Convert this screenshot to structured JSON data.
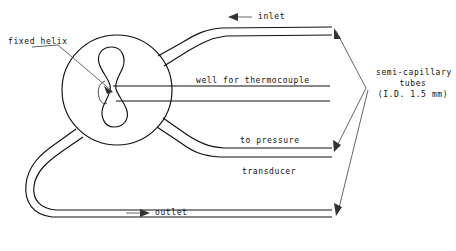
{
  "figure": {
    "width": 456,
    "height": 251,
    "background_color": "#ffffff",
    "line_color": "#111111"
  },
  "labels": {
    "fixed_helix": "fixed helix",
    "inlet": "inlet",
    "well_for_thermocouple": "well for thermocouple",
    "to_pressure": "to pressure",
    "transducer": "transducer",
    "outlet": "outlet",
    "semi_capillary_line1": "semi-capillary",
    "semi_capillary_line2": "tubes",
    "semi_capillary_line3": "(I.D. 1.5 mm)"
  },
  "arrows": {
    "inlet_direction": "left",
    "inlet_glyph": "←",
    "outlet_direction": "right",
    "outlet_glyph": "→"
  },
  "components": [
    {
      "name": "vessel-body",
      "shape": "circle",
      "label": ""
    },
    {
      "name": "fixed-helix",
      "shape": "hourglass",
      "label": "fixed helix"
    },
    {
      "name": "inlet-tube",
      "shape": "tube",
      "label": "inlet"
    },
    {
      "name": "thermocouple-well-tube",
      "shape": "tube",
      "label": "well for thermocouple"
    },
    {
      "name": "pressure-transducer-tube",
      "shape": "tube",
      "label": "to pressure transducer"
    },
    {
      "name": "outlet-tube",
      "shape": "tube",
      "label": "outlet"
    }
  ]
}
